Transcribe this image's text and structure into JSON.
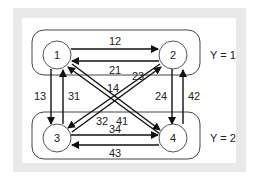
{
  "diagram": {
    "groups": [
      {
        "id": "top",
        "label": "Y = 1"
      },
      {
        "id": "bottom",
        "label": "Y = 2"
      }
    ],
    "nodes": [
      {
        "id": "1",
        "label": "1",
        "group": "Y = 1"
      },
      {
        "id": "2",
        "label": "2",
        "group": "Y = 1"
      },
      {
        "id": "3",
        "label": "3",
        "group": "Y = 2"
      },
      {
        "id": "4",
        "label": "4",
        "group": "Y = 2"
      }
    ],
    "edges": {
      "e12": "12",
      "e21": "21",
      "e13": "13",
      "e31": "31",
      "e24": "24",
      "e42": "42",
      "e34": "34",
      "e43": "43",
      "e14": "14",
      "e41": "41",
      "e23": "23",
      "e32": "32"
    }
  }
}
